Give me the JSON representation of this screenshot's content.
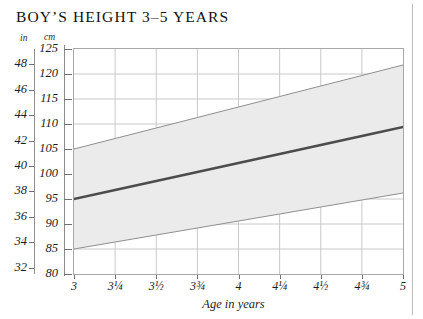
{
  "title": "BOY’S HEIGHT 3–5 YEARS",
  "units": {
    "inches_caption": "in",
    "cm_caption": "cm"
  },
  "axis": {
    "x_label": "Age in years",
    "x_ticks": [
      "3",
      "3¼",
      "3½",
      "3¾",
      "4",
      "4¼",
      "4½",
      "4¾",
      "5"
    ],
    "y_cm_ticks": [
      "125",
      "120",
      "115",
      "110",
      "105",
      "100",
      "95",
      "90",
      "85",
      "80"
    ],
    "y_in_ticks": [
      "48",
      "46",
      "44",
      "42",
      "40",
      "38",
      "36",
      "34",
      "32"
    ]
  },
  "colors": {
    "band_fill": "#ebebeb",
    "band_edge": "#8f8f8f",
    "median_line": "#4c4c4c",
    "grid": "#c9c9c9",
    "frame": "#a8a8a8",
    "margin_rule": "#b9b9b9",
    "text": "#1a1a1a"
  },
  "chart_data": {
    "type": "area",
    "title": "BOY’S HEIGHT 3–5 YEARS",
    "xlabel": "Age in years",
    "ylabel": "cm",
    "ylabel_secondary": "in",
    "xlim": [
      3,
      5
    ],
    "ylim": [
      80,
      125
    ],
    "ylim_secondary": [
      31.5,
      49.2
    ],
    "grid": true,
    "legend": "none",
    "x": [
      3,
      3.25,
      3.5,
      3.75,
      4,
      4.25,
      4.5,
      4.75,
      5
    ],
    "series": [
      {
        "name": "Upper range (approx. 97th centile)",
        "units": "cm",
        "values": [
          105.0,
          107.1,
          109.2,
          111.3,
          113.4,
          115.5,
          117.6,
          119.7,
          121.8
        ]
      },
      {
        "name": "Median height (50th centile)",
        "units": "cm",
        "values": [
          95.0,
          96.8,
          98.6,
          100.4,
          102.2,
          104.0,
          105.8,
          107.6,
          109.4
        ]
      },
      {
        "name": "Lower range (approx. 3rd centile)",
        "units": "cm",
        "values": [
          85.0,
          86.4,
          87.8,
          89.2,
          90.6,
          92.0,
          93.4,
          94.8,
          96.2
        ]
      }
    ],
    "annotations": [
      "Shaded band spans the normal height range between the lower and upper centiles.",
      "Heavy central line is the median height."
    ]
  }
}
